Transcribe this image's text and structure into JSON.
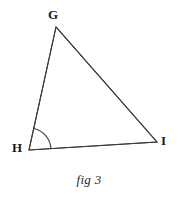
{
  "figure": {
    "caption": "fig 3",
    "background_color": "#ffffff",
    "stroke_color": "#3a3a3a",
    "label_color": "#1a1a1a",
    "width": 178,
    "height": 197
  },
  "diagram": {
    "type": "triangle",
    "name": "triangle-ghi",
    "vertices": [
      {
        "id": "G",
        "label": "G",
        "x": 56,
        "y": 27
      },
      {
        "id": "H",
        "label": "H",
        "x": 29,
        "y": 150
      },
      {
        "id": "I",
        "label": "I",
        "x": 157,
        "y": 142
      }
    ],
    "edges": [
      {
        "id": "GH",
        "from": "G",
        "to": "H"
      },
      {
        "id": "HI",
        "from": "H",
        "to": "I"
      },
      {
        "id": "GI",
        "from": "G",
        "to": "I"
      }
    ],
    "angle_marks": [
      {
        "id": "angle-h",
        "at_vertex": "H",
        "radius": 22,
        "between": [
          "HG",
          "HI"
        ],
        "label": ""
      }
    ]
  },
  "labels": {
    "g": "G",
    "h": "H",
    "i": "I"
  }
}
